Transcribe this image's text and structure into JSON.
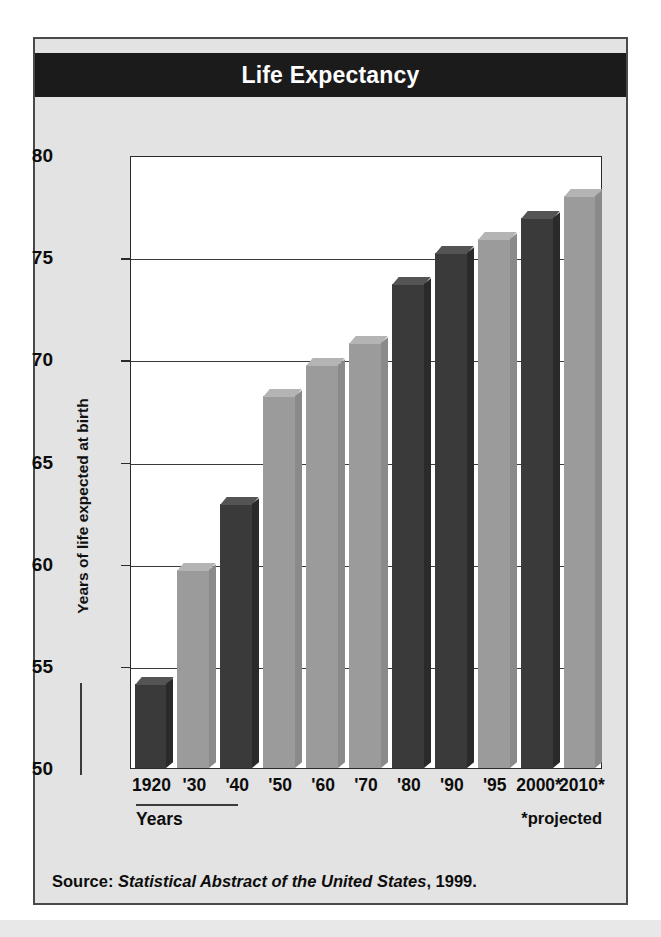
{
  "card": {
    "title": "Life Expectancy",
    "source_prefix": "Source: ",
    "source_italic": "Statistical Abstract of the United States",
    "source_suffix": ", 1999.",
    "years_label": "Years",
    "projected_note": "*projected"
  },
  "colors": {
    "banner_bg": "#1b1b1b",
    "banner_text": "#ffffff",
    "card_bg": "#e3e3e3",
    "card_border": "#4a4a4a",
    "plot_bg": "#ffffff",
    "axis": "#2b2b2b",
    "bar_dark": "#3a3a3a",
    "bar_dark_top": "#545454",
    "bar_dark_side": "#2a2a2a",
    "bar_light": "#9b9b9b",
    "bar_light_top": "#b4b4b4",
    "bar_light_side": "#8a8a8a"
  },
  "chart_data": {
    "type": "bar",
    "title": "Life Expectancy",
    "xlabel": "Years",
    "ylabel": "Years of life expected at birth",
    "ylim": [
      50,
      80
    ],
    "yticks": [
      50,
      55,
      60,
      65,
      70,
      75,
      80
    ],
    "grid": true,
    "legend": "none",
    "categories": [
      "1920",
      "'30",
      "'40",
      "'50",
      "'60",
      "'70",
      "'80",
      "'90",
      "'95",
      "2000*",
      "2010*"
    ],
    "values": [
      54.1,
      59.7,
      62.9,
      68.2,
      69.7,
      70.8,
      73.7,
      75.2,
      75.9,
      76.9,
      78.0
    ],
    "bar_shades": [
      "dark",
      "light",
      "dark",
      "light",
      "light",
      "light",
      "dark",
      "dark",
      "light",
      "dark",
      "light"
    ],
    "annotations": [
      "*projected"
    ],
    "note": "Bars for 2000 and 2010 are projected values"
  }
}
